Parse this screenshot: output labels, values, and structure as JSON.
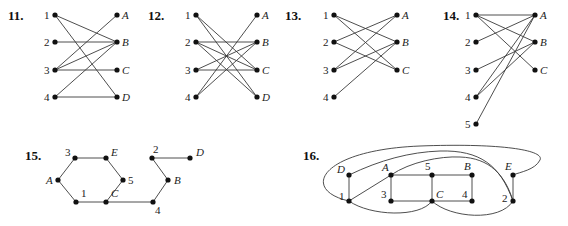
{
  "figures": [
    {
      "id": "11",
      "number_label": "11.",
      "type": "bipartite",
      "left": [
        {
          "name": "1",
          "x": 55,
          "y": 15
        },
        {
          "name": "2",
          "x": 55,
          "y": 42
        },
        {
          "name": "3",
          "x": 55,
          "y": 70
        },
        {
          "name": "4",
          "x": 55,
          "y": 97
        }
      ],
      "right": [
        {
          "name": "A",
          "x": 117,
          "y": 15
        },
        {
          "name": "B",
          "x": 117,
          "y": 42
        },
        {
          "name": "C",
          "x": 117,
          "y": 70
        },
        {
          "name": "D",
          "x": 117,
          "y": 97
        }
      ],
      "edges": [
        [
          "1",
          "B"
        ],
        [
          "1",
          "D"
        ],
        [
          "2",
          "B"
        ],
        [
          "3",
          "A"
        ],
        [
          "3",
          "B"
        ],
        [
          "3",
          "C"
        ],
        [
          "4",
          "B"
        ],
        [
          "4",
          "D"
        ]
      ],
      "label_pos": {
        "x": 8,
        "y": 20
      }
    },
    {
      "id": "12",
      "number_label": "12.",
      "type": "bipartite",
      "left": [
        {
          "name": "1",
          "x": 196,
          "y": 15
        },
        {
          "name": "2",
          "x": 196,
          "y": 42
        },
        {
          "name": "3",
          "x": 196,
          "y": 70
        },
        {
          "name": "4",
          "x": 196,
          "y": 97
        }
      ],
      "right": [
        {
          "name": "A",
          "x": 257,
          "y": 15
        },
        {
          "name": "B",
          "x": 257,
          "y": 42
        },
        {
          "name": "C",
          "x": 257,
          "y": 70
        },
        {
          "name": "D",
          "x": 257,
          "y": 97
        }
      ],
      "edges": [
        [
          "1",
          "C"
        ],
        [
          "1",
          "D"
        ],
        [
          "2",
          "B"
        ],
        [
          "2",
          "C"
        ],
        [
          "2",
          "D"
        ],
        [
          "3",
          "B"
        ],
        [
          "3",
          "C"
        ],
        [
          "4",
          "A"
        ],
        [
          "4",
          "B"
        ]
      ],
      "label_pos": {
        "x": 148,
        "y": 20
      }
    },
    {
      "id": "13",
      "number_label": "13.",
      "type": "bipartite",
      "left": [
        {
          "name": "1",
          "x": 334,
          "y": 15
        },
        {
          "name": "2",
          "x": 334,
          "y": 42
        },
        {
          "name": "3",
          "x": 334,
          "y": 70
        },
        {
          "name": "4",
          "x": 334,
          "y": 97
        }
      ],
      "right": [
        {
          "name": "A",
          "x": 397,
          "y": 15
        },
        {
          "name": "B",
          "x": 397,
          "y": 42
        },
        {
          "name": "C",
          "x": 397,
          "y": 70
        }
      ],
      "edges": [
        [
          "1",
          "B"
        ],
        [
          "1",
          "C"
        ],
        [
          "2",
          "A"
        ],
        [
          "2",
          "C"
        ],
        [
          "3",
          "A"
        ],
        [
          "3",
          "B"
        ],
        [
          "4",
          "B"
        ]
      ],
      "label_pos": {
        "x": 285,
        "y": 20
      }
    },
    {
      "id": "14",
      "number_label": "14.",
      "type": "bipartite",
      "left": [
        {
          "name": "1",
          "x": 476,
          "y": 15
        },
        {
          "name": "2",
          "x": 476,
          "y": 42
        },
        {
          "name": "3",
          "x": 476,
          "y": 70
        },
        {
          "name": "4",
          "x": 476,
          "y": 97
        },
        {
          "name": "5",
          "x": 476,
          "y": 124
        }
      ],
      "right": [
        {
          "name": "A",
          "x": 535,
          "y": 15
        },
        {
          "name": "B",
          "x": 535,
          "y": 42
        },
        {
          "name": "C",
          "x": 535,
          "y": 70
        }
      ],
      "edges": [
        [
          "1",
          "A"
        ],
        [
          "1",
          "B"
        ],
        [
          "1",
          "C"
        ],
        [
          "2",
          "A"
        ],
        [
          "3",
          "B"
        ],
        [
          "4",
          "A"
        ],
        [
          "4",
          "B"
        ],
        [
          "5",
          "A"
        ]
      ],
      "label_pos": {
        "x": 443,
        "y": 20
      }
    },
    {
      "id": "15",
      "number_label": "15.",
      "type": "general",
      "nodes": [
        {
          "name": "3",
          "x": 75,
          "y": 158,
          "lx": -10,
          "ly": -2
        },
        {
          "name": "E",
          "x": 106,
          "y": 158,
          "lx": 5,
          "ly": -2
        },
        {
          "name": "A",
          "x": 58,
          "y": 180,
          "lx": -12,
          "ly": 4
        },
        {
          "name": "5",
          "x": 123,
          "y": 180,
          "lx": 5,
          "ly": 4
        },
        {
          "name": "1",
          "x": 76,
          "y": 202,
          "lx": 5,
          "ly": -5
        },
        {
          "name": "C",
          "x": 106,
          "y": 202,
          "lx": 5,
          "ly": -5
        },
        {
          "name": "4",
          "x": 153,
          "y": 202,
          "lx": 2,
          "ly": 12
        },
        {
          "name": "B",
          "x": 168,
          "y": 180,
          "lx": 6,
          "ly": 4
        },
        {
          "name": "2",
          "x": 152,
          "y": 158,
          "lx": 1,
          "ly": -5
        },
        {
          "name": "D",
          "x": 190,
          "y": 158,
          "lx": 6,
          "ly": -2
        }
      ],
      "edges": [
        [
          "3",
          "E"
        ],
        [
          "3",
          "A"
        ],
        [
          "A",
          "1"
        ],
        [
          "1",
          "C"
        ],
        [
          "E",
          "5"
        ],
        [
          "5",
          "C"
        ],
        [
          "C",
          "4"
        ],
        [
          "4",
          "B"
        ],
        [
          "B",
          "2"
        ],
        [
          "2",
          "D"
        ]
      ],
      "label_pos": {
        "x": 25,
        "y": 160
      }
    },
    {
      "id": "16",
      "number_label": "16.",
      "type": "general",
      "nodes": [
        {
          "name": "D",
          "x": 349,
          "y": 175,
          "lx": -12,
          "ly": -2
        },
        {
          "name": "A",
          "x": 391,
          "y": 175,
          "lx": -9,
          "ly": -4
        },
        {
          "name": "5",
          "x": 432,
          "y": 175,
          "lx": -7,
          "ly": -5
        },
        {
          "name": "B",
          "x": 472,
          "y": 175,
          "lx": -8,
          "ly": -5
        },
        {
          "name": "E",
          "x": 513,
          "y": 175,
          "lx": -8,
          "ly": -5
        },
        {
          "name": "1",
          "x": 349,
          "y": 201,
          "lx": -10,
          "ly": -1
        },
        {
          "name": "3",
          "x": 391,
          "y": 201,
          "lx": -10,
          "ly": -3
        },
        {
          "name": "C",
          "x": 432,
          "y": 201,
          "lx": 4,
          "ly": -3
        },
        {
          "name": "4",
          "x": 472,
          "y": 201,
          "lx": -10,
          "ly": -3
        },
        {
          "name": "2",
          "x": 513,
          "y": 201,
          "lx": -11,
          "ly": 1
        }
      ],
      "edges": [
        [
          "D",
          "1"
        ],
        [
          "A",
          "1"
        ],
        [
          "A",
          "3"
        ],
        [
          "A",
          "5"
        ],
        [
          "5",
          "B"
        ],
        [
          "5",
          "C"
        ],
        [
          "B",
          "4"
        ],
        [
          "3",
          "C"
        ],
        [
          "C",
          "4"
        ],
        [
          "E",
          "2"
        ]
      ],
      "curves": [
        {
          "from": "1",
          "to": "E",
          "path": "M349,201 C300,190 320,150 420,146 C500,143 545,150 540,160 C535,170 520,172 513,175"
        },
        {
          "from": "D",
          "to": "2",
          "path": "M349,175 C380,160 410,152 440,151 C480,150 500,165 513,201"
        },
        {
          "from": "A",
          "to": "2",
          "path": "M391,175 C410,162 440,156 460,157 C490,158 505,175 513,201"
        },
        {
          "from": "1",
          "to": "C",
          "path": "M349,201 C370,216 420,218 432,201"
        },
        {
          "from": "C",
          "to": "2",
          "path": "M432,201 C450,218 500,222 513,201"
        }
      ],
      "label_pos": {
        "x": 303,
        "y": 160
      }
    }
  ]
}
